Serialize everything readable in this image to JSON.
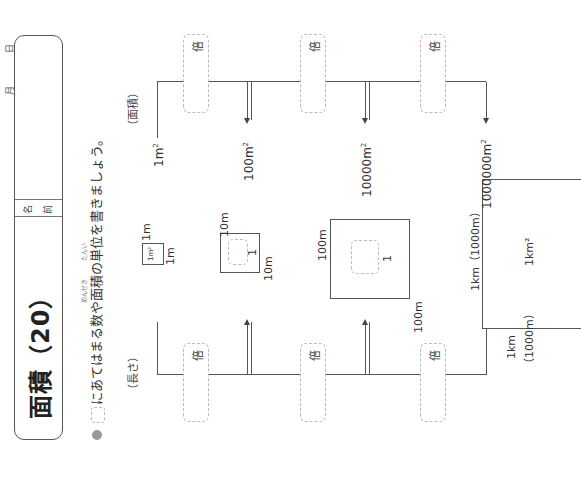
{
  "header": {
    "title": "面積（20）",
    "name_label_1": "名",
    "name_label_2": "前",
    "month_label": "月",
    "day_label": "日"
  },
  "instruction": {
    "text": "にあてはまる数や面積の単位を書きましょう。",
    "ruby_menseki": "めんせき",
    "ruby_tani": "たんい"
  },
  "sections": {
    "length_label": "（長さ）",
    "area_label": "（面積）"
  },
  "multiplier_label": "倍",
  "length_chain": [
    {
      "value": "1m"
    },
    {
      "value": "10m"
    },
    {
      "value": "100m"
    },
    {
      "value": "1km",
      "note": "（1000m）"
    }
  ],
  "area_chain": [
    {
      "value": "1m",
      "sup": "2"
    },
    {
      "value": "100m",
      "sup": "2"
    },
    {
      "value": "10000m",
      "sup": "2"
    },
    {
      "value": "1000000m",
      "sup": "2"
    }
  ],
  "squares": [
    {
      "side_v": "1m",
      "side_h": "1m",
      "inner": "1m²",
      "inner_answer": ""
    },
    {
      "side_v": "10m",
      "side_h": "10m",
      "inner": "",
      "inner_answer": "1"
    },
    {
      "side_v": "100m",
      "side_h": "100m",
      "inner": "",
      "inner_answer": "1"
    },
    {
      "side_v": "1km（1000m）",
      "side_h": "1km",
      "side_h_note": "（1000m）",
      "inner": "1km²"
    }
  ]
}
